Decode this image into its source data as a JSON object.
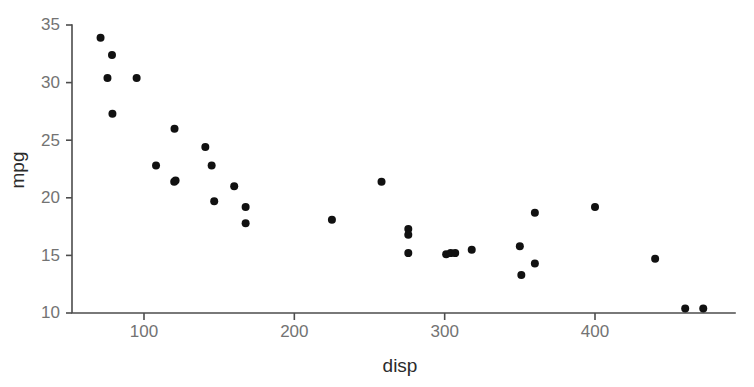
{
  "chart_data": {
    "type": "scatter",
    "title": "",
    "subtitle": "",
    "xlabel": "disp",
    "ylabel": "mpg",
    "xlim": [
      62,
      480
    ],
    "ylim": [
      9.2,
      35.4
    ],
    "xticks": [
      100,
      200,
      300,
      400
    ],
    "xtick_labels": [
      "100",
      "200",
      "300",
      "400"
    ],
    "yticks": [
      10,
      15,
      20,
      25,
      30,
      35
    ],
    "ytick_labels": [
      "10",
      "15",
      "20",
      "25",
      "30",
      "35"
    ],
    "grid": false,
    "legend": false,
    "legend_position": "none",
    "point_color": "#111111",
    "point_size": 8,
    "axis_color": "#4d4d4d",
    "tick_label_color": "#737373",
    "axis_title_color": "#2b2b2b",
    "background": "#ffffff",
    "n_points": 32,
    "series": [
      {
        "name": "mtcars",
        "x": [
          71.1,
          75.7,
          78.7,
          79.0,
          95.1,
          108.0,
          120.1,
          120.3,
          121.0,
          140.8,
          145.0,
          146.7,
          160.0,
          160.0,
          167.6,
          167.6,
          225.0,
          258.0,
          275.8,
          275.8,
          275.8,
          301.0,
          304.0,
          307.0,
          318.0,
          350.0,
          351.0,
          360.0,
          360.0,
          400.0,
          440.0,
          460.0,
          472.0
        ],
        "y": [
          33.9,
          32.4,
          32.4,
          30.4,
          30.4,
          22.8,
          21.4,
          21.4,
          26.0,
          24.4,
          22.8,
          19.2,
          21.0,
          21.0,
          19.7,
          17.8,
          18.1,
          21.4,
          17.3,
          16.4,
          15.2,
          19.2,
          15.2,
          15.5,
          15.5,
          15.8,
          13.3,
          14.3,
          15.0,
          19.2,
          14.7,
          10.4,
          10.4
        ]
      }
    ],
    "points": [
      {
        "x": 71.1,
        "y": 33.9
      },
      {
        "x": 78.7,
        "y": 32.4
      },
      {
        "x": 75.7,
        "y": 30.4
      },
      {
        "x": 95.1,
        "y": 30.4
      },
      {
        "x": 79.0,
        "y": 27.3
      },
      {
        "x": 120.3,
        "y": 26.0
      },
      {
        "x": 108.0,
        "y": 22.8
      },
      {
        "x": 140.8,
        "y": 24.4
      },
      {
        "x": 145.0,
        "y": 22.8
      },
      {
        "x": 120.1,
        "y": 21.4
      },
      {
        "x": 121.0,
        "y": 21.5
      },
      {
        "x": 146.7,
        "y": 19.7
      },
      {
        "x": 160.0,
        "y": 21.0
      },
      {
        "x": 167.6,
        "y": 19.2
      },
      {
        "x": 167.6,
        "y": 17.8
      },
      {
        "x": 225.0,
        "y": 18.1
      },
      {
        "x": 258.0,
        "y": 21.4
      },
      {
        "x": 275.8,
        "y": 17.3
      },
      {
        "x": 275.8,
        "y": 16.8
      },
      {
        "x": 275.8,
        "y": 15.2
      },
      {
        "x": 301.0,
        "y": 15.1
      },
      {
        "x": 304.0,
        "y": 15.2
      },
      {
        "x": 307.0,
        "y": 15.2
      },
      {
        "x": 318.0,
        "y": 15.5
      },
      {
        "x": 350.0,
        "y": 15.8
      },
      {
        "x": 351.0,
        "y": 13.3
      },
      {
        "x": 360.0,
        "y": 14.3
      },
      {
        "x": 360.0,
        "y": 18.7
      },
      {
        "x": 400.0,
        "y": 19.2
      },
      {
        "x": 440.0,
        "y": 14.7
      },
      {
        "x": 460.0,
        "y": 10.4
      },
      {
        "x": 472.0,
        "y": 10.4
      }
    ]
  }
}
